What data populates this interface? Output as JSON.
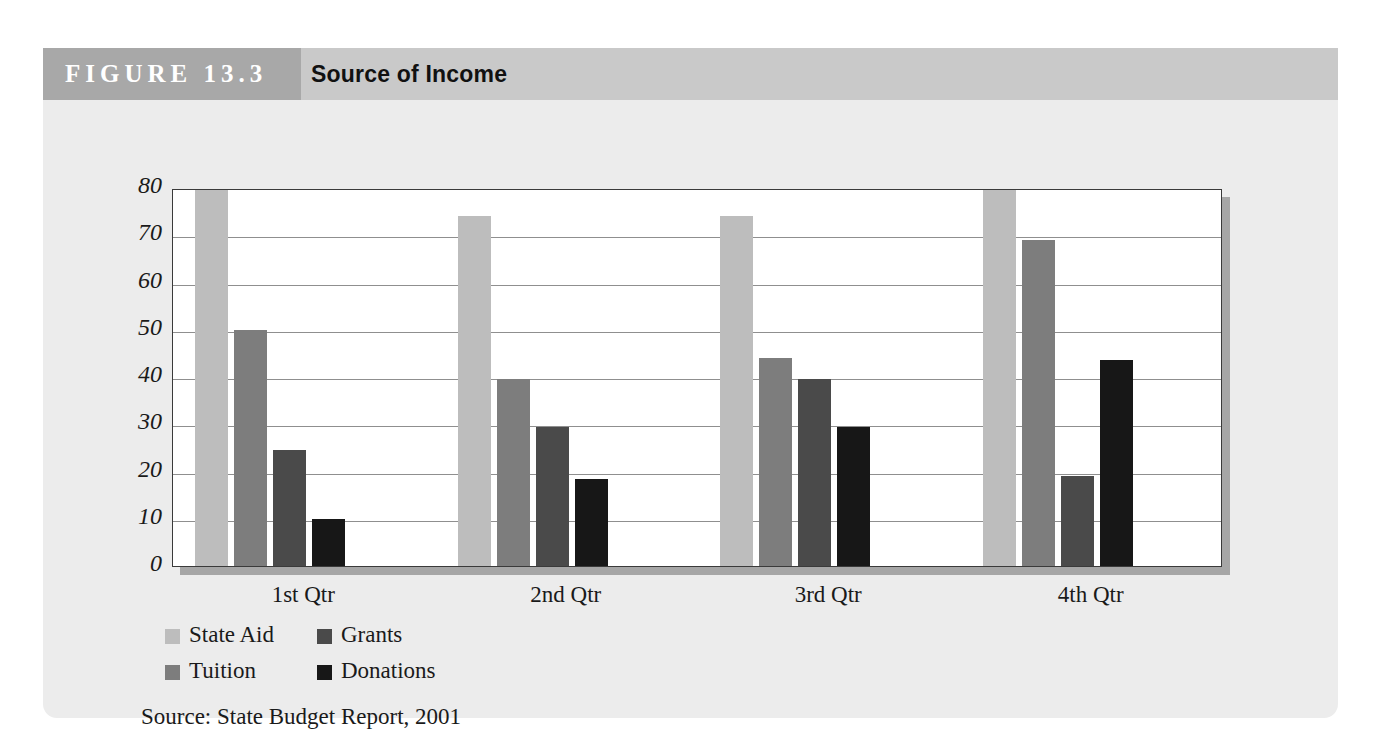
{
  "figure": {
    "number_label": "FIGURE 13.3",
    "title": "Source of Income",
    "source_note": "Source: State Budget Report, 2001"
  },
  "colors": {
    "header_band": "#c9c9c9",
    "number_band": "#a8a8a8",
    "card_background": "#ececec",
    "plot_background": "#ffffff",
    "plot_border": "#3a3a3a",
    "gridline": "#8f8f8f",
    "state_aid": "#bdbdbd",
    "tuition": "#7d7d7d",
    "grants": "#4a4a4a",
    "donations": "#171717"
  },
  "chart_data": {
    "type": "bar",
    "title": "Source of Income",
    "xlabel": "",
    "ylabel": "",
    "ylim": [
      0,
      80
    ],
    "yticks": [
      0,
      10,
      20,
      30,
      40,
      50,
      60,
      70,
      80
    ],
    "grid": true,
    "legend_position": "bottom-left",
    "categories": [
      "1st Qtr",
      "2nd Qtr",
      "3rd Qtr",
      "4th Qtr"
    ],
    "series": [
      {
        "name": "State Aid",
        "color": "#bdbdbd",
        "values": [
          80,
          74,
          74,
          79.5
        ]
      },
      {
        "name": "Tuition",
        "color": "#7d7d7d",
        "values": [
          50,
          39.5,
          44,
          69
        ]
      },
      {
        "name": "Grants",
        "color": "#4a4a4a",
        "values": [
          24.5,
          29.5,
          39.5,
          19
        ]
      },
      {
        "name": "Donations",
        "color": "#171717",
        "values": [
          10,
          18.5,
          29.5,
          43.5
        ]
      }
    ]
  },
  "legend": {
    "entries": [
      {
        "label": "State Aid",
        "color": "#bdbdbd"
      },
      {
        "label": "Grants",
        "color": "#4a4a4a"
      },
      {
        "label": "Tuition",
        "color": "#7d7d7d"
      },
      {
        "label": "Donations",
        "color": "#171717"
      }
    ]
  }
}
